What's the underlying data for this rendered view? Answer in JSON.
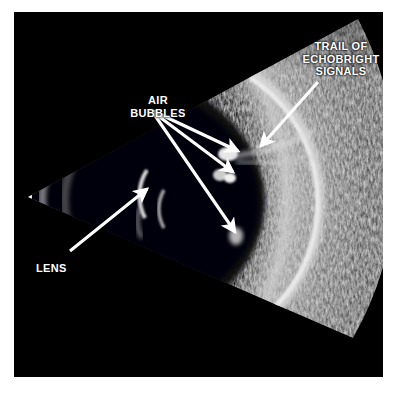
{
  "figure": {
    "kind": "ocular-b-scan-ultrasound",
    "width": 401,
    "height": 393,
    "page_background": "#ffffff",
    "field_background": "#000000"
  },
  "annotations": {
    "trail": {
      "label": "TRAIL OF\nECHOBRIGHT\nSIGNALS",
      "color": "#ffffff",
      "arrow": {
        "from_x": 318,
        "from_y": 82,
        "to_x": 258,
        "to_y": 149
      }
    },
    "air_bubbles": {
      "label": "AIR\nBUBBLES",
      "color": "#ffffff",
      "arrows": [
        {
          "from_x": 153,
          "from_y": 111,
          "to_x": 241,
          "to_y": 153
        },
        {
          "from_x": 153,
          "from_y": 112,
          "to_x": 236,
          "to_y": 174
        },
        {
          "from_x": 154,
          "from_y": 114,
          "to_x": 237,
          "to_y": 234
        }
      ]
    },
    "lens": {
      "label": "LENS",
      "color": "#ffffff",
      "arrow": {
        "from_x": 70,
        "from_y": 251,
        "to_x": 149,
        "to_y": 187
      }
    }
  },
  "scan_geometry": {
    "apex_x": 28,
    "apex_y": 197,
    "sector_span_degrees": 56,
    "sector_rotation_degrees": -10,
    "outer_radius": 332,
    "probe_arc_color": "#ffffff",
    "vitreous_color": "#05050a",
    "tissue_color": "#9a9a9a"
  }
}
